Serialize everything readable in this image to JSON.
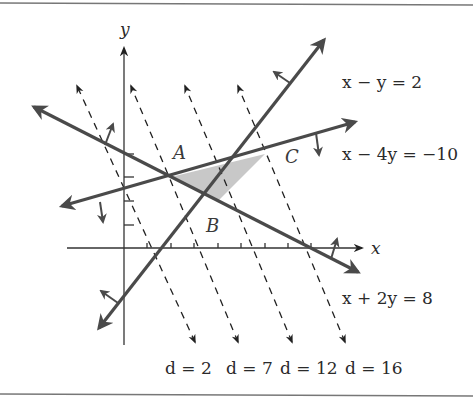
{
  "figure": {
    "axes": {
      "x_label": "x",
      "y_label": "y",
      "x_ticks": [
        1,
        2,
        3,
        4,
        5,
        6,
        7,
        8
      ],
      "y_ticks": [
        1,
        2,
        3,
        4
      ]
    },
    "constraints": [
      {
        "id": "c1",
        "label": "x − y = 2",
        "a": 1,
        "b": -1,
        "c": 2
      },
      {
        "id": "c2",
        "label": "x − 4y = −10",
        "a": 1,
        "b": -4,
        "c": -10
      },
      {
        "id": "c3",
        "label": "x + 2y = 8",
        "a": 1,
        "b": 2,
        "c": 8
      }
    ],
    "vertices": [
      {
        "label": "A",
        "x": 2,
        "y": 3
      },
      {
        "label": "B",
        "x": 4,
        "y": 2
      },
      {
        "label": "C",
        "x": 6,
        "y": 4
      }
    ],
    "objective": "d = 2x + y",
    "level_lines": [
      {
        "label": "d = 2",
        "d": 2
      },
      {
        "label": "d = 7",
        "d": 7
      },
      {
        "label": "d = 12",
        "d": 12
      },
      {
        "label": "d = 16",
        "d": 16
      }
    ],
    "colors": {
      "line": "#4a4a4a",
      "axis": "#333333",
      "shade": "#c8c8c8",
      "border": "#777777"
    }
  }
}
